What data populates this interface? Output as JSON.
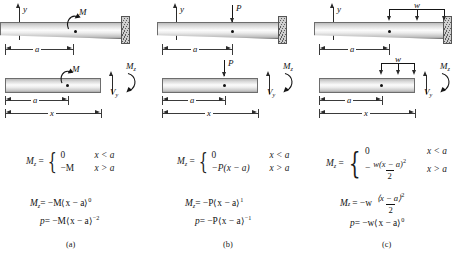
{
  "figure": {
    "columns": [
      {
        "id": "a",
        "caption": "(a)",
        "load_label": "M",
        "axis_y": "y",
        "axis_x": "x",
        "dim_a": "a",
        "dim_x": "x",
        "fbd_moment_label": "M",
        "internal_moment": "M",
        "internal_moment_sub": "z",
        "internal_shear": "V",
        "internal_shear_sub": "y",
        "equations": {
          "piecewise_lhs": "M",
          "piecewise_lhs_sub": "z",
          "case1_value": "0",
          "case1_cond": "x < a",
          "case2_value": "−M",
          "case2_cond": "x > a",
          "line2": "M",
          "line2_sub": "z",
          "line2_rhs": "= −M⟨x − a⟩",
          "line2_exp": "0",
          "line3": "p",
          "line3_rhs": "= −M⟨x − a⟩",
          "line3_exp": "−2"
        }
      },
      {
        "id": "b",
        "caption": "(b)",
        "load_label": "P",
        "axis_y": "y",
        "axis_x": "x",
        "dim_a": "a",
        "dim_x": "x",
        "fbd_moment_label": "P",
        "internal_moment": "M",
        "internal_moment_sub": "z",
        "internal_shear": "V",
        "internal_shear_sub": "y",
        "equations": {
          "piecewise_lhs": "M",
          "piecewise_lhs_sub": "z",
          "case1_value": "0",
          "case1_cond": "x < a",
          "case2_value": "−P(x − a)",
          "case2_cond": "x > a",
          "line2": "M",
          "line2_sub": "z",
          "line2_rhs": "= −P⟨x − a⟩",
          "line2_exp": "1",
          "line3": "p",
          "line3_rhs": "= −P⟨x − a⟩",
          "line3_exp": "−1"
        }
      },
      {
        "id": "c",
        "caption": "(c)",
        "load_label": "w",
        "axis_y": "y",
        "axis_x": "x",
        "dim_a": "a",
        "dim_x": "x",
        "fbd_moment_label": "w",
        "internal_moment": "M",
        "internal_moment_sub": "z",
        "internal_shear": "V",
        "internal_shear_sub": "y",
        "equations": {
          "piecewise_lhs": "M",
          "piecewise_lhs_sub": "z",
          "case1_value": "0",
          "case1_cond": "x < a",
          "case2_num": "w(x − a)",
          "case2_num_exp": "2",
          "case2_den": "2",
          "case2_sign": "−",
          "case2_cond": "x > a",
          "line2": "M",
          "line2_sub": "z",
          "line2_lead": "= −w",
          "line2_num": "⟨x − a⟩",
          "line2_num_exp": "2",
          "line2_den": "2",
          "line3": "p",
          "line3_rhs": "= −w⟨x − a⟩",
          "line3_exp": "0"
        }
      }
    ]
  }
}
